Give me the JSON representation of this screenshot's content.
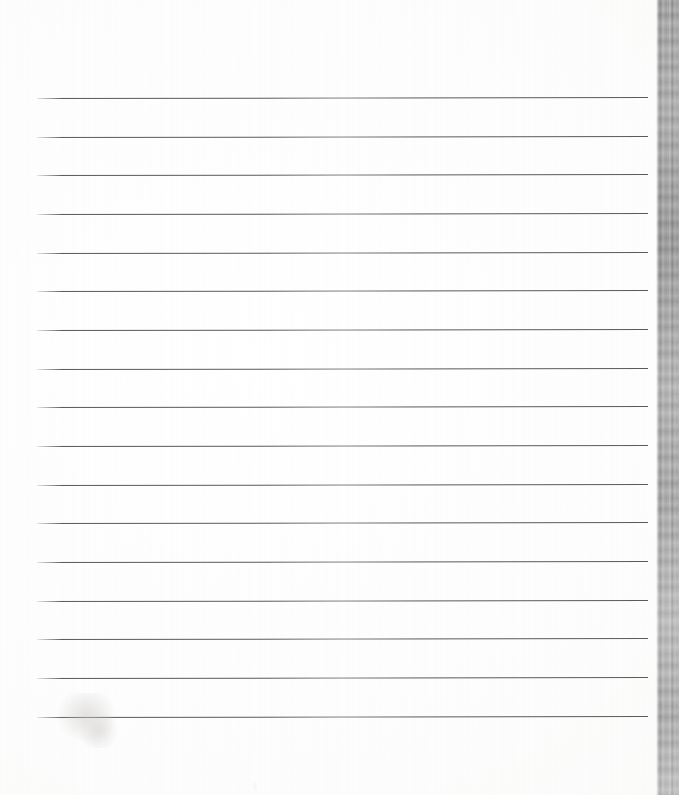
{
  "document": {
    "kind": "scanned-lined-paper",
    "title": "Blank ruled writing paper (scan)",
    "page_width": 679,
    "page_height": 795,
    "background_color": "#fefefe",
    "is_blank": true,
    "visible_text": ""
  },
  "sheet": {
    "left": 0,
    "top": 0,
    "width": 656,
    "height": 795,
    "paper_color": "#fdfdfd"
  },
  "ruling": {
    "line_count": 17,
    "line_color": "#4e4e4e",
    "line_thickness_px": 1.4,
    "line_left_px": 37,
    "line_right_px": 648,
    "first_line_y_px": 98,
    "line_spacing_px": 38.75,
    "top_margin_px": 98,
    "bottom_margin_px": 77,
    "lines": [
      {
        "index": 1,
        "y": 98,
        "left": 37,
        "width": 611,
        "slope_deg": -0.09
      },
      {
        "index": 2,
        "y": 137,
        "left": 37,
        "width": 611,
        "slope_deg": -0.09
      },
      {
        "index": 3,
        "y": 175,
        "left": 37,
        "width": 611,
        "slope_deg": -0.09
      },
      {
        "index": 4,
        "y": 214,
        "left": 37,
        "width": 611,
        "slope_deg": -0.09
      },
      {
        "index": 5,
        "y": 253,
        "left": 37,
        "width": 611,
        "slope_deg": -0.09
      },
      {
        "index": 6,
        "y": 291,
        "left": 37,
        "width": 611,
        "slope_deg": -0.09
      },
      {
        "index": 7,
        "y": 330,
        "left": 37,
        "width": 611,
        "slope_deg": -0.09
      },
      {
        "index": 8,
        "y": 369,
        "left": 37,
        "width": 611,
        "slope_deg": -0.09
      },
      {
        "index": 9,
        "y": 407,
        "left": 37,
        "width": 611,
        "slope_deg": -0.09
      },
      {
        "index": 10,
        "y": 446,
        "left": 37,
        "width": 611,
        "slope_deg": -0.09
      },
      {
        "index": 11,
        "y": 485,
        "left": 37,
        "width": 611,
        "slope_deg": -0.09
      },
      {
        "index": 12,
        "y": 523,
        "left": 37,
        "width": 611,
        "slope_deg": -0.09
      },
      {
        "index": 13,
        "y": 562,
        "left": 37,
        "width": 611,
        "slope_deg": -0.09
      },
      {
        "index": 14,
        "y": 601,
        "left": 37,
        "width": 611,
        "slope_deg": -0.09
      },
      {
        "index": 15,
        "y": 639,
        "left": 37,
        "width": 611,
        "slope_deg": -0.09
      },
      {
        "index": 16,
        "y": 678,
        "left": 37,
        "width": 611,
        "slope_deg": -0.09
      },
      {
        "index": 17,
        "y": 717,
        "left": 37,
        "width": 611,
        "slope_deg": -0.09
      }
    ]
  },
  "marks": [
    {
      "name": "pencil-smudge",
      "description": "faint grey pencil/graphite smudge across the last ruled line, lower left",
      "left": 55,
      "top": 693,
      "width": 70,
      "height": 55,
      "color": "#c9c6c4",
      "opacity": 0.5
    },
    {
      "name": "faint-spot",
      "description": "very faint speck below the last line",
      "left": 252,
      "top": 782,
      "width": 6,
      "height": 9,
      "color": "#eceaea",
      "opacity": 0.45
    }
  ],
  "scan_edge": {
    "name": "scanner-edge-band",
    "description": "mottled grey vertical band at the right side of the scan (scanner lid / platen edge)",
    "left": 656,
    "top": 0,
    "width": 23,
    "height": 795,
    "base_color": "#a3a3a3",
    "light_streak_color": "#d2d2d2",
    "dark_streak_color": "#8a8a8a"
  }
}
